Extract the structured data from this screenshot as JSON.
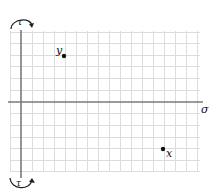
{
  "diagram": {
    "axes": {
      "horizontal_label": "σ",
      "vertical_top_label": "τ",
      "vertical_bottom_label": "τ"
    },
    "points": [
      {
        "name": "y",
        "label": "y"
      },
      {
        "name": "x",
        "label": "x"
      }
    ],
    "colors": {
      "grid": "#dcdcdc",
      "axis": "#7a7a7a",
      "point": "#111111"
    }
  }
}
